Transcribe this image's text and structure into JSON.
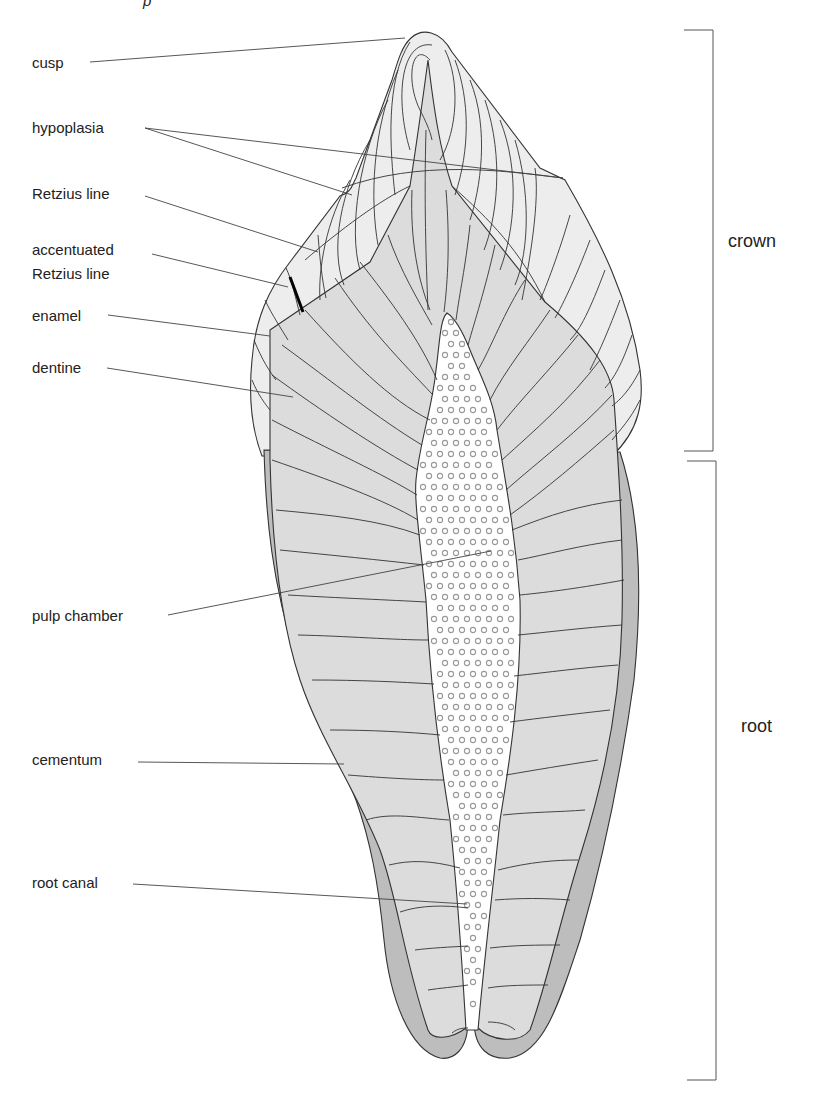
{
  "figure": {
    "title_fragment": "p",
    "colors": {
      "background": "#ffffff",
      "enamel": "#ededed",
      "dentine": "#dcdcdc",
      "cementum": "#bdbdbd",
      "pulp": "#ffffff",
      "pulp_dots": "#999999",
      "lines": "#333333",
      "accentuated_line": "#000000"
    },
    "labels": [
      {
        "id": "cusp",
        "text": "cusp",
        "x": 32,
        "y": 68,
        "leader": [
          [
            90,
            61
          ],
          [
            405,
            38
          ]
        ]
      },
      {
        "id": "hypoplasia",
        "text": "hypoplasia",
        "x": 32,
        "y": 133,
        "leader": [
          [
            145,
            128
          ],
          [
            352,
            195
          ]
        ],
        "leader2": [
          [
            145,
            128
          ],
          [
            563,
            178
          ]
        ]
      },
      {
        "id": "retzius-line",
        "text": "Retzius line",
        "x": 32,
        "y": 199,
        "leader": [
          [
            145,
            196
          ],
          [
            318,
            252
          ]
        ]
      },
      {
        "id": "accentuated-retzius-line",
        "text": "accentuated",
        "text2": "Retzius line",
        "x": 32,
        "y": 255,
        "y2": 279,
        "leader": [
          [
            152,
            254
          ],
          [
            288,
            287
          ]
        ]
      },
      {
        "id": "enamel",
        "text": "enamel",
        "x": 32,
        "y": 321,
        "leader": [
          [
            108,
            315
          ],
          [
            270,
            336
          ]
        ]
      },
      {
        "id": "dentine",
        "text": "dentine",
        "x": 32,
        "y": 373,
        "leader": [
          [
            107,
            368
          ],
          [
            293,
            397
          ]
        ]
      },
      {
        "id": "pulp-chamber",
        "text": "pulp chamber",
        "x": 32,
        "y": 621,
        "leader": [
          [
            168,
            615
          ],
          [
            491,
            551
          ]
        ]
      },
      {
        "id": "cementum",
        "text": "cementum",
        "x": 32,
        "y": 765,
        "leader": [
          [
            138,
            762
          ],
          [
            344,
            764
          ]
        ]
      },
      {
        "id": "root-canal",
        "text": "root canal",
        "x": 32,
        "y": 888,
        "leader": [
          [
            133,
            884
          ],
          [
            467,
            904
          ]
        ]
      }
    ],
    "regions": [
      {
        "id": "crown",
        "text": "crown",
        "x": 728,
        "y": 247,
        "bracket": {
          "x": 713,
          "top": 30,
          "bottom": 451,
          "tick_left": 684
        }
      },
      {
        "id": "root",
        "text": "root",
        "x": 741,
        "y": 732,
        "bracket": {
          "x": 716,
          "top": 461,
          "bottom": 1080,
          "tick_left": 687
        }
      }
    ]
  }
}
